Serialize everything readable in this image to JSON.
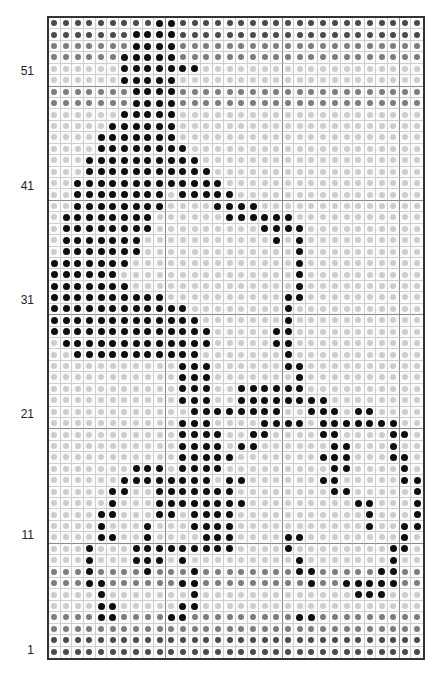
{
  "chart_data": {
    "type": "table",
    "columns": 32,
    "rows": 56,
    "row_labels": [
      {
        "label": "51",
        "row": 51
      },
      {
        "label": "41",
        "row": 41
      },
      {
        "label": "31",
        "row": 31
      },
      {
        "label": "21",
        "row": 21
      },
      {
        "label": "11",
        "row": 11
      },
      {
        "label": "1",
        "row": 1
      }
    ],
    "legend": {
      "D": {
        "name": "dark grey",
        "color": "#4a4a4a"
      },
      "M": {
        "name": "medium grey",
        "color": "#7d7d7d"
      },
      "L": {
        "name": "light grey (background)",
        "color": "#cdcdcd"
      },
      "K": {
        "name": "black (motif)",
        "color": "#0d0d0d"
      }
    },
    "grid_rows_top_to_bottom": [
      "DDDDDDDDDKKDDDDDDDDDDDDDDDDDDDDD",
      "DDDDDDDKKKKDDDDDDDDDDDDDDDDDDDDD",
      "MMMMMMMKKKKMMMMMMMMMMMMMMMMMMMMM",
      "MMMMMMKKKKKMMMMMMMMMMMMMMMMMMMMM",
      "LLLLLLKKKKKKKLLLLLLLLLLLLLLLLLLL",
      "LLLLLLKKKKKLLLLLLLLLLLLLLLLLLLLL",
      "MMMMMMMKKKKMMMMMMMMMMMMMMMMMMMMM",
      "MMMMMMMKKKKMMMMMMMMMMMMMMMMMMMMM",
      "LLLLLLKKKKKLLLLLLLLLLLLLLLLLLLLL",
      "LLLLLKKKKKKLLLLLLLLLLLLLLLLLLLLL",
      "LLLLKKKKKKKLLLLLLLLLLLLLLLLLLLLL",
      "LLLLKKKKKKKKLLLLLLLLLLLLLLLLLLLL",
      "LLLKKKKKKKKKKLLLLLLLLLLLLLLLLLLL",
      "LLLKKKKKKKKKKKLLLLLLLLLLLLLLLLLL",
      "LLKKKKKKKKKKKKKLLLLLLLLLLLLLLLLL",
      "LLKKKKKKKKLKKKKKLLLLLLLLLLLLLLLL",
      "LLKKKKKKKKLLLLKKKKLLLLLLLLLLLLLL",
      "LKKKKKKKKLLLLLLKKKKKKLLLLLLLLLLL",
      "LKKKKKKKKLLLLLLLLLKKKKLLLLLLLLLL",
      "LKKKKKKKLLLLLLLLLLLKLKLLLLLLLLLL",
      "LKKKKKKKLLLLLLLLLLLLLKLLLLLLLLLL",
      "KKKKKKKLLLLLLLLLLLLLLKLLLLLLLLLL",
      "KKKKKKLLLLLLLLLLLLLLLKLLLLLLLLLL",
      "KKKKKKKLLLLLLLLLLLLLLKLLLLLLLLLL",
      "KKKKKKKKKKLLLLLLLLLLKKLLLLLLLLLL",
      "KKKKKKKKKKKKLLLLLLLLKLLLLLLLLLLL",
      "KKKKKKKKKKKKKLLLLLLLKLLLLLLLLLLL",
      "KKKKKKKKKKKKKKLLLLLKKLLLLLLLLLLL",
      "LKKKKKKKKKKKKKLLLLLKKLLLLLLLLLLL",
      "LLKKKKKKKKKKKLLLLLLLKLLLLLLLLLLL",
      "LLLLLLLLLLLKKKLLLLLLKKLLLLLLLLLL",
      "LLLLLLLLLLLKKKLLLLLLLKLLLLLLLLLL",
      "LLLLLLLLLLLKKKLLKKKKKKLLLLLLLLLL",
      "LLLLLLLLLLLKKKLLKKKKKKKKLLLLLLLL",
      "LLLLLLLLLLLLKKKKKKKKLLKKKLKKLLLL",
      "LLLLLLLLLLLKKKLLLLKKKKLKKKKKKKLL",
      "LLLLLLLLLLLKKKKLLKKLLLLKKLLLLKKL",
      "LLLLLLLLLLLKKKKLKKLLLLLLKKLLLKLL",
      "LLLLLLLLLLLKKKKKLLLLLLLKKKLLLKKL",
      "LLLLLLLKKKLKKKKLLLLLLLLLKKLLLLKL",
      "LLLLLLKKKKKKKKLKKLLLLLLKKLLLLLKK",
      "LLLLLKKLLKKKKKKKLLLLLLLLKKLLLLLK",
      "LLLLLKLLLKKKKKKKKLLLLLLLLLKKLLLK",
      "LLLLKKLLLKKLKKKKLLLLLLLLLLLKLLLK",
      "LLLLKLLLKLLLKKKKLLLLLLLLLLLKLLKK",
      "LLLLKKLLKLLLLKKKLLLLKKLLLLLLLLKL",
      "LLLKLLLKKKKKKKKKLLLLKLLLLLLLLKKL",
      "LLLKLLLKKKLKLLLLLLLLLKLLLLLLLKLL",
      "MMMKMMMMKMMMKMMMMMMMMKKMMMMMKKMM",
      "MMMKKMMMMMMKKMMMMMMMMMKMMKKKKKMM",
      "LLLLKLLLLLLLKLLLLLLLLLLLLLKKKLLL",
      "LLLLKKLLLLLKKLLLLLLLLLLLLLLLLLLL",
      "MMMMKKMMMMKKMMMMMMMMMKKMMMMMMMMM",
      "MMMMMMMMMMMMMMMMMMMMMMMMMMMMMMMM",
      "DDDDDDDDDDDDDDDDDDDDDDDDDDDDDDDD",
      "DDDDDDDDDDDDDDDDDDDDDDDDDDDDDDDD"
    ]
  }
}
